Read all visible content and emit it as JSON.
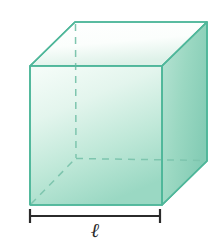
{
  "figure": {
    "type": "geometric-solid-diagram",
    "shape_name": "cube",
    "caption_label": "ℓ",
    "label_meaning": "edge length",
    "colors": {
      "edge_stroke": "#4fb79a",
      "hidden_edge_stroke": "#7ec5ae",
      "top_face_fill_light": "#fdfefd",
      "top_face_fill_dark": "#dff2ea",
      "front_face_fill_light": "#f2fbf7",
      "front_face_fill_dark": "#9ed9c4",
      "right_face_fill_light": "#b6e2d3",
      "right_face_fill_dark": "#86ceb8",
      "dimension_bar": "#2b2b2b",
      "label_text": "#2b2b2b",
      "background": "#ffffff"
    },
    "geometry": {
      "front_face": [
        [
          30,
          66
        ],
        [
          162,
          66
        ],
        [
          162,
          205
        ],
        [
          30,
          205
        ]
      ],
      "top_face": [
        [
          30,
          66
        ],
        [
          75,
          22
        ],
        [
          207,
          22
        ],
        [
          162,
          66
        ]
      ],
      "right_face": [
        [
          162,
          66
        ],
        [
          207,
          22
        ],
        [
          207,
          161
        ],
        [
          162,
          205
        ]
      ],
      "hidden_vertex": [
        76,
        158
      ],
      "hidden_edges": [
        {
          "name": "back-vertical-left",
          "from": [
            75,
            22
          ],
          "to": [
            76,
            158
          ]
        },
        {
          "name": "back-bottom-horizontal",
          "from": [
            76,
            158
          ],
          "to": [
            207,
            161
          ]
        },
        {
          "name": "back-bottom-diagonal",
          "from": [
            30,
            205
          ],
          "to": [
            76,
            158
          ]
        }
      ]
    },
    "dimension": {
      "name": "width-dimension-bar",
      "x_start": 29,
      "x_end": 160,
      "y": 216,
      "tick_height": 14,
      "label": "ℓ"
    }
  }
}
